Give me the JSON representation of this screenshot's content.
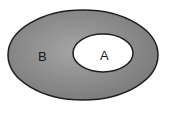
{
  "diagram": {
    "type": "venn",
    "sets": [
      {
        "id": "B",
        "label": "B",
        "fill": "#8c8c8c",
        "contains": [
          "A"
        ]
      },
      {
        "id": "A",
        "label": "A",
        "fill": "#ffffff"
      }
    ],
    "colors": {
      "outer_fill": "#8c8c8c",
      "inner_fill": "#ffffff",
      "stroke": "#1e1e1e",
      "background": "#ffffff"
    }
  }
}
